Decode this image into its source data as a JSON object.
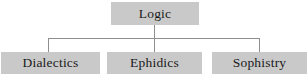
{
  "diagram": {
    "type": "hierarchy-tree",
    "background_color": "#ffffff",
    "box_fill_color": "#c9c9c9",
    "text_color": "#1a1a1a",
    "connector_color": "#8e8e8e",
    "root": {
      "label": "Logic"
    },
    "children": [
      {
        "label": "Dialectics"
      },
      {
        "label": "Ephidics"
      },
      {
        "label": "Sophistry"
      }
    ]
  }
}
